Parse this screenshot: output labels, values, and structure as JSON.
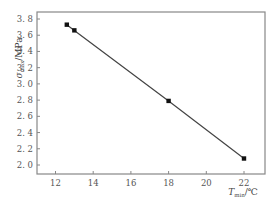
{
  "chart_data": {
    "type": "line",
    "title": "",
    "xlabel": "T_min/℃",
    "xlabel_main": "T",
    "xlabel_sub": "min",
    "xlabel_unit": "/℃",
    "ylabel": "σ_max/MPa",
    "ylabel_main": "σ",
    "ylabel_sub": "max",
    "ylabel_unit": "/MPa",
    "xlim": [
      10.9,
      23.1
    ],
    "ylim": [
      1.88,
      3.9
    ],
    "xticks": [
      12,
      14,
      16,
      18,
      20,
      22
    ],
    "xtick_labels": [
      "12",
      "14",
      "16",
      "18",
      "20",
      "22"
    ],
    "yticks": [
      2.0,
      2.2,
      2.4,
      2.6,
      2.8,
      3.0,
      3.2,
      3.4,
      3.6,
      3.8
    ],
    "ytick_labels": [
      "2.0",
      "2.2",
      "2.4",
      "2.6",
      "2.8",
      "3.0",
      "3.2",
      "3.4",
      "3.6",
      "3.8"
    ],
    "grid": false,
    "legend": null,
    "series": [
      {
        "name": "σmax vs Tmin",
        "marker": "square",
        "color": "#222222",
        "x": [
          12.6,
          13.0,
          18.0,
          22.0
        ],
        "values": [
          3.73,
          3.66,
          2.79,
          2.08
        ]
      }
    ]
  },
  "colors": {
    "axis": "#888888",
    "line": "#444444",
    "marker": "#111111",
    "background": "#ffffff"
  }
}
